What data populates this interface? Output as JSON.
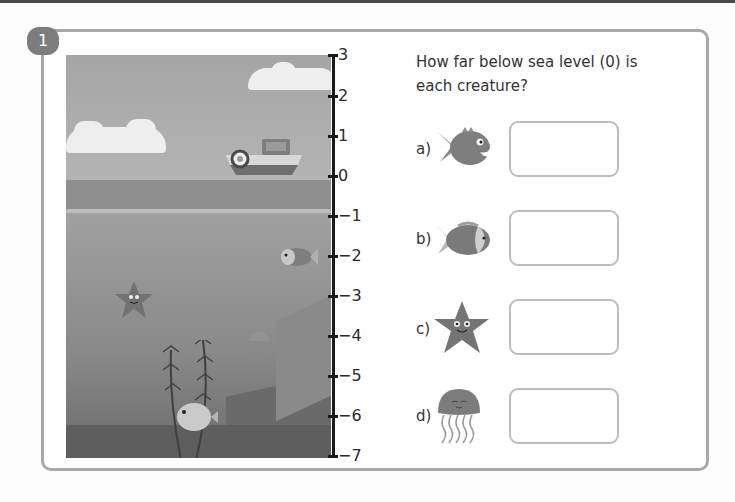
{
  "question": {
    "number": "1",
    "prompt": "How far below sea level (0) is each creature?"
  },
  "number_line": {
    "ticks": [
      "3",
      "2",
      "1",
      "0",
      "−1",
      "−2",
      "−3",
      "−4",
      "−5",
      "−6",
      "−7"
    ]
  },
  "items": [
    {
      "label": "a)",
      "creature": "piranha-fish",
      "answer": ""
    },
    {
      "label": "b)",
      "creature": "clownfish",
      "answer": ""
    },
    {
      "label": "c)",
      "creature": "starfish",
      "answer": ""
    },
    {
      "label": "d)",
      "creature": "jellyfish",
      "answer": ""
    }
  ],
  "colors": {
    "frame": "#a8a8a8",
    "badge": "#7d7d7d",
    "answer_border": "#bdbdbd"
  }
}
